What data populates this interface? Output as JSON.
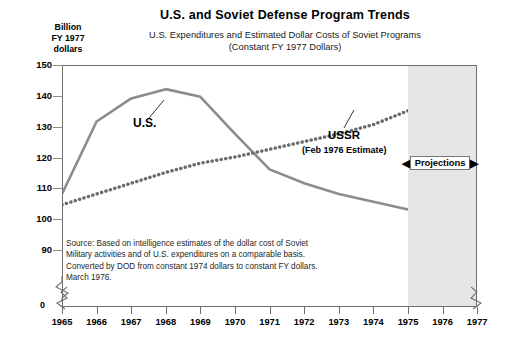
{
  "header": {
    "title": "U.S. and Soviet Defense Program Trends",
    "subtitle_line1": "U.S. Expenditures and Estimated Dollar Costs of Soviet Programs",
    "subtitle_line2": "(Constant FY 1977 Dollars)"
  },
  "axis_caption": {
    "line1": "Billion",
    "line2": "FY 1977",
    "line3": "dollars"
  },
  "annotations": {
    "us_label": "U.S.",
    "ussr_label": "USSR",
    "ussr_sublabel": "(Feb 1976 Estimate)",
    "projections_label": "Projections",
    "arrow_left": "◀",
    "arrow_right": "▶",
    "zero_label": "0"
  },
  "source_note": {
    "line1": "Source: Based on intelligence estimates of the dollar cost of Soviet",
    "line2": "Military activities and of U.S. expenditures on a comparable basis.",
    "line3": "Converted by DOD from constant 1974 dollars to constant FY dollars.",
    "line4": "March 1976."
  },
  "colors": {
    "us_line": "#8c8c8c",
    "ussr_line": "#6b6b6b",
    "frame": "#6f6f6f",
    "projection_shade": "#e6e6e6",
    "text": "#000000"
  },
  "chart_data": {
    "type": "line",
    "title": "U.S. and Soviet Defense Program Trends",
    "subtitle": "U.S. Expenditures and Estimated Dollar Costs of Soviet Programs (Constant FY 1977 Dollars)",
    "xlabel": "",
    "ylabel": "Billion FY 1977 dollars",
    "x": [
      1965,
      1966,
      1967,
      1968,
      1969,
      1970,
      1971,
      1972,
      1973,
      1974,
      1975,
      1976,
      1977
    ],
    "categories": [
      "1965",
      "1966",
      "1967",
      "1968",
      "1969",
      "1970",
      "1971",
      "1972",
      "1973",
      "1974",
      "1975",
      "1976",
      "1977"
    ],
    "ytick_values": [
      90,
      100,
      110,
      120,
      130,
      140,
      150
    ],
    "ytick_labels": [
      "90",
      "100",
      "110",
      "120",
      "130",
      "140",
      "150"
    ],
    "ylim": [
      86,
      150
    ],
    "axis_break": true,
    "grid": false,
    "legend": "inline-annotations",
    "projection_region": {
      "from": 1975,
      "to": 1977,
      "label": "Projections"
    },
    "series": [
      {
        "name": "U.S.",
        "style": "solid",
        "color": "#8c8c8c",
        "values": [
          108.5,
          132.0,
          139.5,
          142.5,
          140.0,
          128.0,
          116.5,
          112.0,
          108.5,
          106.0,
          103.5,
          110.0,
          114.5
        ]
      },
      {
        "name": "USSR (Feb 1976 Estimate)",
        "style": "dotted",
        "color": "#6b6b6b",
        "values": [
          105.0,
          108.5,
          112.0,
          115.5,
          118.5,
          120.5,
          123.0,
          125.5,
          128.0,
          131.0,
          135.5,
          142.0,
          149.0
        ]
      }
    ]
  }
}
